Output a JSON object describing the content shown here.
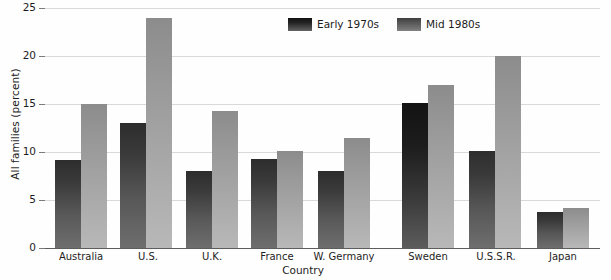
{
  "chart_data": {
    "type": "bar",
    "title": "",
    "xlabel": "Country",
    "ylabel": "All families (percent)",
    "categories": [
      "Australia",
      "U.S.",
      "U.K.",
      "France",
      "W. Germany",
      "Sweden",
      "U.S.S.R.",
      "Japan"
    ],
    "series": [
      {
        "name": "Early 1970s",
        "color": "#3a3a3a",
        "values": [
          9.2,
          13.0,
          8.0,
          9.3,
          8.0,
          15.1,
          10.1,
          3.7
        ]
      },
      {
        "name": "Mid 1980s",
        "color": "#a0a0a0",
        "values": [
          15.0,
          24.0,
          14.3,
          10.1,
          11.5,
          17.0,
          20.0,
          4.2
        ]
      }
    ],
    "ylim": [
      0,
      25
    ],
    "yticks": [
      0,
      5,
      10,
      15,
      20,
      25
    ],
    "ytick_labels": [
      "0",
      "5",
      "10",
      "15",
      "20",
      "25"
    ],
    "grid": "horizontal",
    "legend_position": "top-center"
  },
  "axes": {
    "y_title": "All families (percent)",
    "x_title": "Country"
  },
  "legend": {
    "entries": [
      {
        "label": "Early 1970s",
        "swatch": "dark-gray"
      },
      {
        "label": "Mid 1980s",
        "swatch": "medium-gray"
      }
    ]
  }
}
